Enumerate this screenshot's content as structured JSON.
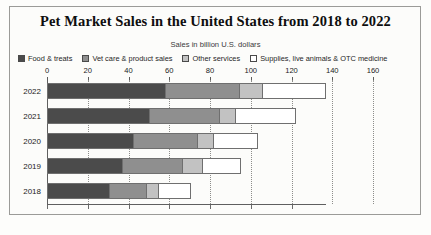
{
  "chart_data": {
    "type": "bar",
    "orientation": "horizontal",
    "stacked": true,
    "title": "Pet Market Sales in the United States from 2018 to 2022",
    "subtitle": "Sales in billion U.S. dollars",
    "xlabel": "",
    "ylabel": "",
    "xlim": [
      0,
      160
    ],
    "xticks": [
      0,
      20,
      40,
      60,
      80,
      100,
      120,
      140,
      160
    ],
    "grid": true,
    "legend_position": "top",
    "categories": [
      "2022",
      "2021",
      "2020",
      "2019",
      "2018"
    ],
    "series": [
      {
        "name": "Food & treats",
        "color": "#4b4b4b",
        "values": [
          58.1,
          50.0,
          42.0,
          36.9,
          30.3
        ]
      },
      {
        "name": "Vet care & product sales",
        "color": "#8f8f8f",
        "values": [
          35.9,
          34.3,
          31.4,
          29.3,
          18.1
        ]
      },
      {
        "name": "Other services",
        "color": "#c2c2c2",
        "values": [
          11.4,
          8.1,
          8.1,
          9.7,
          6.1
        ]
      },
      {
        "name": "Supplies, live animals & OTC medicine",
        "color": "#ffffff",
        "values": [
          31.5,
          29.8,
          22.1,
          19.2,
          16.0
        ]
      }
    ],
    "totals": [
      136.9,
      122.2,
      103.6,
      95.1,
      70.5
    ]
  },
  "legend": {
    "items": [
      {
        "label": "Food & treats",
        "swatch": "#4b4b4b"
      },
      {
        "label": "Vet care & product sales",
        "swatch": "#8f8f8f"
      },
      {
        "label": "Other services",
        "swatch": "#c2c2c2"
      },
      {
        "label": "Supplies, live animals & OTC medicine",
        "swatch": "#ffffff"
      }
    ]
  }
}
